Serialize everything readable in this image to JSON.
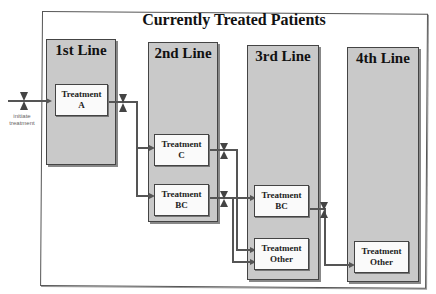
{
  "title": "Currently Treated Patients",
  "columns": [
    {
      "label": "1st Line"
    },
    {
      "label": "2nd Line"
    },
    {
      "label": "3rd Line"
    },
    {
      "label": "4th Line"
    }
  ],
  "boxes": {
    "a": {
      "line1": "Treatment",
      "line2": "A"
    },
    "c": {
      "line1": "Treatment",
      "line2": "C"
    },
    "bc2": {
      "line1": "Treatment",
      "line2": "BC"
    },
    "bc3": {
      "line1": "Treatment",
      "line2": "BC"
    },
    "other3": {
      "line1": "Treatment",
      "line2": "Other"
    },
    "other4": {
      "line1": "Treatment",
      "line2": "Other"
    }
  },
  "entry_note": {
    "line1": "initiate",
    "line2": "treatment"
  },
  "colors": {
    "column_fill": "#c9c9c9",
    "wire": "#555555",
    "box_fill": "#fafafa"
  }
}
